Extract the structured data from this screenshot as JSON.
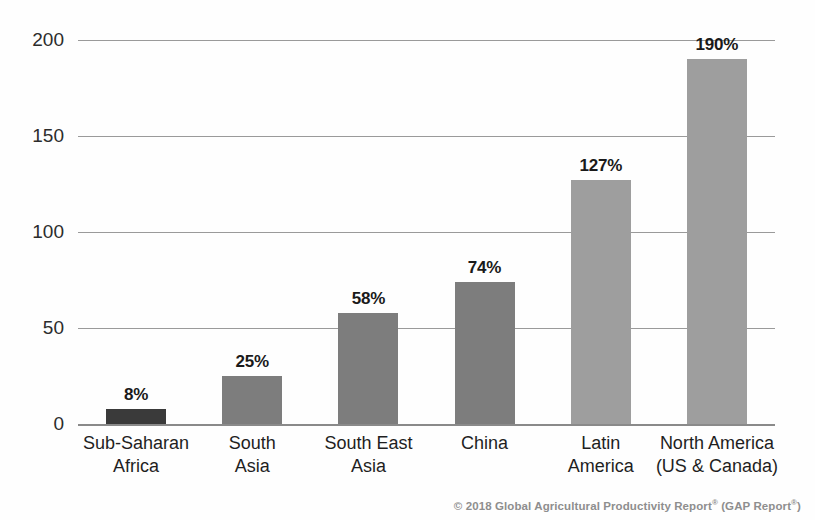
{
  "chart_data": {
    "type": "bar",
    "title": "",
    "subtitle": "",
    "xlabel": "",
    "ylabel": "",
    "ylim": [
      0,
      200
    ],
    "yticks": [
      0,
      50,
      100,
      150,
      200
    ],
    "ytick_labels": [
      "0",
      "50",
      "100",
      "150",
      "200"
    ],
    "grid": true,
    "legend": "none",
    "categories": [
      "Sub-Saharan Africa",
      "South Asia",
      "South East Asia",
      "China",
      "Latin America",
      "North America (US & Canada)"
    ],
    "category_lines": [
      [
        "Sub-Saharan",
        "Africa"
      ],
      [
        "South",
        "Asia"
      ],
      [
        "South East",
        "Asia"
      ],
      [
        "China",
        ""
      ],
      [
        "Latin",
        "America"
      ],
      [
        "North America",
        "(US & Canada)"
      ]
    ],
    "values": [
      8,
      25,
      58,
      74,
      127,
      190
    ],
    "value_labels": [
      "8%",
      "25%",
      "58%",
      "74%",
      "127%",
      "190%"
    ],
    "bar_colors": [
      "#3a3a3a",
      "#7d7d7d",
      "#7d7d7d",
      "#7d7d7d",
      "#9e9e9e",
      "#9e9e9e"
    ]
  },
  "footer": {
    "copyright": "© 2018 Global Agricultural Productivity Report",
    "mark1": "®",
    "middle": " (GAP Report",
    "mark2": "®",
    "close": ")"
  },
  "colors": {
    "gridline": "#9a9a9a",
    "baseline": "#8a8a8a",
    "dark_bar": "#3a3a3a",
    "mid_bar": "#7d7d7d",
    "light_bar": "#9e9e9e",
    "text": "#1f1f1f",
    "footer_text": "#8e8e8e",
    "background": "#fefefe"
  }
}
